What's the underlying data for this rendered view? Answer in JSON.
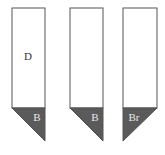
{
  "diagram": {
    "colors": {
      "stroke": "#555555",
      "fill": "#ffffff",
      "tip_fill": "#5a5a5a",
      "tip_text": "#e8e8e8",
      "text": "#333333"
    },
    "bars": [
      {
        "body_label": "D",
        "tip_label": "B",
        "tip_direction": "right"
      },
      {
        "body_label": "",
        "tip_label": "B",
        "tip_direction": "right"
      },
      {
        "body_label": "",
        "tip_label": "Br",
        "tip_direction": "left"
      }
    ]
  }
}
